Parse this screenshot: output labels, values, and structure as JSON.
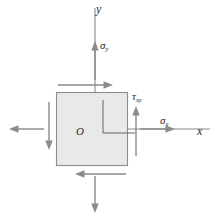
{
  "figure": {
    "background_color": "#ffffff",
    "stroke_color": "#8a8a8a",
    "element_fill_color": "#e9e9e9",
    "element_border_color": "#8c8c8c",
    "label_color": "#2b2b2b"
  },
  "labels": {
    "y_axis": "y",
    "x_axis": "x",
    "origin": "O",
    "sigma_x_base": "σ",
    "sigma_x_sub": "x",
    "sigma_y_base": "σ",
    "sigma_y_sub": "y",
    "tau_xy_base": "τ",
    "tau_xy_sub": "xy"
  },
  "geometry": {
    "canvas_width": 215,
    "canvas_height": 221,
    "element_square": {
      "x": 56,
      "y": 92,
      "width": 72,
      "height": 74
    },
    "origin_point": {
      "x": 92,
      "y": 129
    },
    "y_axis_line": {
      "x": 95,
      "y_top": 8,
      "y_bottom": 92
    },
    "x_axis_line": {
      "y": 129,
      "x_left": 128,
      "x_right": 210
    },
    "inner_axes_corner": {
      "x": 103,
      "y": 133
    }
  },
  "arrows": [
    {
      "name": "sigma-y-top-arrow",
      "direction": "up",
      "kind": "normal-stress"
    },
    {
      "name": "sigma-y-bottom-arrow",
      "direction": "down",
      "kind": "normal-stress"
    },
    {
      "name": "sigma-x-right-arrow",
      "direction": "right",
      "kind": "normal-stress"
    },
    {
      "name": "sigma-x-left-arrow",
      "direction": "left",
      "kind": "normal-stress"
    },
    {
      "name": "tau-top-arrow",
      "direction": "right",
      "kind": "shear-stress"
    },
    {
      "name": "tau-bottom-arrow",
      "direction": "left",
      "kind": "shear-stress"
    },
    {
      "name": "tau-right-arrow",
      "direction": "up",
      "kind": "shear-stress"
    },
    {
      "name": "tau-left-arrow",
      "direction": "down",
      "kind": "shear-stress"
    }
  ]
}
